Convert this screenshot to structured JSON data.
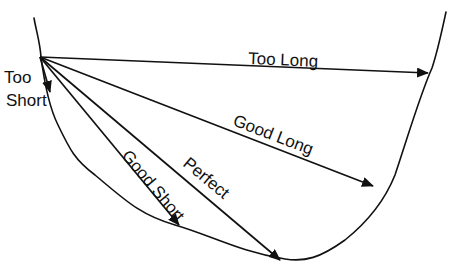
{
  "diagram": {
    "type": "bowl-trajectory",
    "colors": {
      "ink": "#111111",
      "background": "#ffffff"
    },
    "origin": {
      "x": 40,
      "y": 57
    },
    "arrows": [
      {
        "id": "too-short",
        "label": "Too Short",
        "label_lines": [
          "Too",
          "Short"
        ],
        "end": {
          "x": 50,
          "y": 92
        }
      },
      {
        "id": "too-long",
        "label": "Too Long",
        "end": {
          "x": 428,
          "y": 73
        }
      },
      {
        "id": "good-long",
        "label": "Good Long",
        "end": {
          "x": 373,
          "y": 185
        }
      },
      {
        "id": "perfect",
        "label": "Perfect",
        "end": {
          "x": 280,
          "y": 260
        }
      },
      {
        "id": "good-short",
        "label": "Good Short",
        "end": {
          "x": 179,
          "y": 225
        }
      }
    ]
  }
}
